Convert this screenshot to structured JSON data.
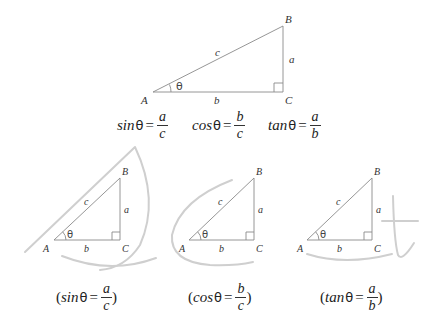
{
  "main_triangle": {
    "vertices": {
      "A": "A",
      "B": "B",
      "C": "C"
    },
    "sides": {
      "hypotenuse": "c",
      "opposite": "a",
      "adjacent": "b"
    },
    "angle": "θ"
  },
  "formulas": [
    {
      "fn": "sin",
      "theta": "θ",
      "eq": "=",
      "num": "a",
      "den": "c"
    },
    {
      "fn": "cos",
      "theta": "θ",
      "eq": "=",
      "num": "b",
      "den": "c"
    },
    {
      "fn": "tan",
      "theta": "θ",
      "eq": "=",
      "num": "a",
      "den": "b"
    }
  ],
  "mnemonic_panels": [
    {
      "letter_hint": "s",
      "vertices": {
        "A": "A",
        "B": "B",
        "C": "C"
      },
      "sides": {
        "c": "c",
        "a": "a",
        "b": "b"
      },
      "angle": "θ",
      "formula": {
        "open": "(",
        "fn": "sin",
        "theta": "θ",
        "eq": "=",
        "num": "a",
        "den": "c",
        "close": ")"
      }
    },
    {
      "letter_hint": "c",
      "vertices": {
        "A": "A",
        "B": "B",
        "C": "C"
      },
      "sides": {
        "c": "c",
        "a": "a",
        "b": "b"
      },
      "angle": "θ",
      "formula": {
        "open": "(",
        "fn": "cos",
        "theta": "θ",
        "eq": "=",
        "num": "b",
        "den": "c",
        "close": ")"
      }
    },
    {
      "letter_hint": "t",
      "vertices": {
        "A": "A",
        "B": "B",
        "C": "C"
      },
      "sides": {
        "c": "c",
        "a": "a",
        "b": "b"
      },
      "angle": "θ",
      "formula": {
        "open": "(",
        "fn": "tan",
        "theta": "θ",
        "eq": "=",
        "num": "a",
        "den": "b",
        "close": ")"
      }
    }
  ],
  "colors": {
    "triangle_line": "#8a8a8a",
    "mnemonic_stroke": "#cfcfcf",
    "text": "#222222"
  }
}
